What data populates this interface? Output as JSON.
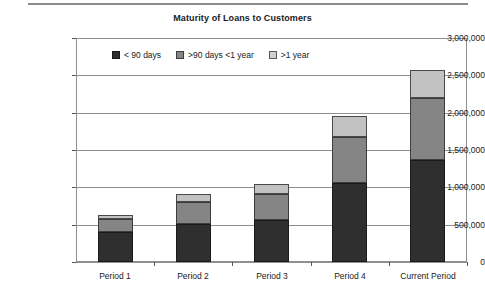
{
  "chart_data": {
    "type": "bar",
    "subtype": "stacked-bar",
    "title": "Maturity of Loans to Customers",
    "xlabel": "",
    "ylabel": "",
    "ylim": [
      0,
      3000000
    ],
    "ytick_labels": [
      "3,000,000",
      "2,500,000",
      "2,000,000",
      "1,500,000",
      "1,000,000",
      "500,000",
      "0"
    ],
    "ytick_values": [
      3000000,
      2500000,
      2000000,
      1500000,
      1000000,
      500000,
      0
    ],
    "grid": true,
    "legend_position": "top-inside-left",
    "categories": [
      "Period 1",
      "Period 2",
      "Period 3",
      "Period 4",
      "Current Period"
    ],
    "series": [
      {
        "name": "< 90 days",
        "color": "#2f2f2f",
        "values": [
          400000,
          510000,
          560000,
          1060000,
          1360000
        ]
      },
      {
        "name": ">90 days <1 year",
        "color": "#858585",
        "values": [
          175000,
          295000,
          355000,
          620000,
          830000
        ]
      },
      {
        "name": ">1 year",
        "color": "#c2c2c2",
        "values": [
          60000,
          105000,
          125000,
          280000,
          375000
        ]
      }
    ],
    "totals": [
      635000,
      910000,
      1040000,
      1960000,
      2565000
    ]
  }
}
